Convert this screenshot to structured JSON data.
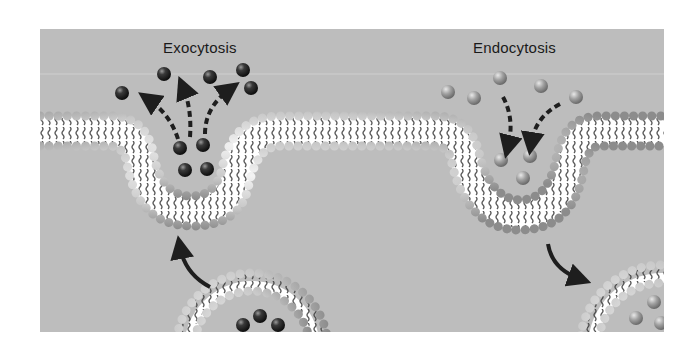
{
  "diagram": {
    "type": "cell-membrane-transport",
    "labels": {
      "exocytosis": "Exocytosis",
      "endocytosis": "Endocytosis"
    },
    "colors": {
      "background": "#bdbdbd",
      "page": "#ffffff",
      "phospholipid_head": "#cfcfcf",
      "lipid_tail": "#3a3a3a",
      "membrane_interior": "#ffffff",
      "exo_particle": "#2a2a2a",
      "endo_particle": "#9a9a9a",
      "arrow": "#1e1e1e"
    },
    "processes": [
      {
        "name": "Exocytosis",
        "description": "Vesicle fuses with membrane and releases dark particles outward",
        "released_particles": 6,
        "particles_in_pocket": 4,
        "vesicle_particles": 3
      },
      {
        "name": "Endocytosis",
        "description": "Membrane invaginates engulfing light particles, pinching off into a vesicle",
        "outside_particles": 5,
        "particles_in_pocket": 3
      }
    ]
  }
}
